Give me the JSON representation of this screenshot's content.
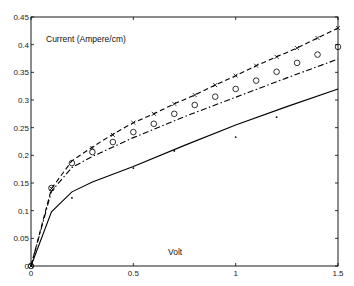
{
  "chart_data": {
    "type": "line",
    "title": "",
    "xlabel": "Volt",
    "ylabel": "Current (Ampere/cm)",
    "xlim": [
      0,
      1.5
    ],
    "ylim": [
      0,
      0.45
    ],
    "grid": false,
    "legend": null,
    "x_ticks": [
      0,
      0.5,
      1,
      1.5
    ],
    "x_tick_labels": [
      "0",
      "0.5",
      "1",
      "1.5"
    ],
    "y_ticks": [
      0,
      0.05,
      0.1,
      0.15,
      0.2,
      0.25,
      0.3,
      0.35,
      0.4,
      0.45
    ],
    "y_tick_labels": [
      "0",
      "0.05",
      "0.1",
      "0.15",
      "0.2",
      "0.25",
      "0.3",
      "0.35",
      "0.4",
      "0.45"
    ],
    "series": [
      {
        "name": "dashed-line",
        "style": "dashed",
        "x": [
          0,
          0.1,
          0.2,
          0.3,
          0.4,
          0.5,
          0.6,
          0.7,
          0.8,
          0.9,
          1.0,
          1.1,
          1.2,
          1.3,
          1.4,
          1.5
        ],
        "values": [
          0,
          0.14,
          0.19,
          0.215,
          0.238,
          0.259,
          0.275,
          0.293,
          0.309,
          0.327,
          0.344,
          0.362,
          0.378,
          0.394,
          0.412,
          0.43
        ]
      },
      {
        "name": "dash-dot-line",
        "style": "dashdot",
        "x": [
          0,
          0.1,
          0.2,
          0.3,
          0.5,
          0.75,
          1.0,
          1.25,
          1.5
        ],
        "values": [
          0,
          0.135,
          0.178,
          0.198,
          0.232,
          0.27,
          0.305,
          0.34,
          0.374
        ]
      },
      {
        "name": "solid-line",
        "style": "solid",
        "x": [
          0,
          0.1,
          0.2,
          0.3,
          0.5,
          0.75,
          1.0,
          1.25,
          1.5
        ],
        "values": [
          0,
          0.098,
          0.134,
          0.152,
          0.18,
          0.218,
          0.255,
          0.288,
          0.32
        ]
      },
      {
        "name": "x-markers",
        "style": "marker-x",
        "x": [
          0,
          0.1,
          0.3,
          0.4,
          0.5,
          0.6,
          0.7,
          0.8,
          0.9,
          1.0,
          1.1,
          1.2,
          1.3,
          1.4,
          1.5
        ],
        "values": [
          0,
          0.14,
          0.213,
          0.237,
          0.259,
          0.275,
          0.293,
          0.309,
          0.327,
          0.344,
          0.362,
          0.378,
          0.394,
          0.412,
          0.43
        ]
      },
      {
        "name": "circle-markers",
        "style": "marker-o",
        "x": [
          0,
          0.1,
          0.2,
          0.3,
          0.4,
          0.5,
          0.6,
          0.7,
          0.8,
          0.9,
          1.0,
          1.1,
          1.2,
          1.3,
          1.4,
          1.5
        ],
        "values": [
          0,
          0.141,
          0.186,
          0.206,
          0.224,
          0.242,
          0.257,
          0.275,
          0.291,
          0.306,
          0.32,
          0.335,
          0.351,
          0.367,
          0.382,
          0.396
        ]
      },
      {
        "name": "dot-markers",
        "style": "marker-dot",
        "x": [
          0,
          0.2,
          0.5,
          0.7,
          1.0,
          1.2
        ],
        "values": [
          0,
          0.123,
          0.177,
          0.208,
          0.233,
          0.269
        ]
      }
    ]
  }
}
